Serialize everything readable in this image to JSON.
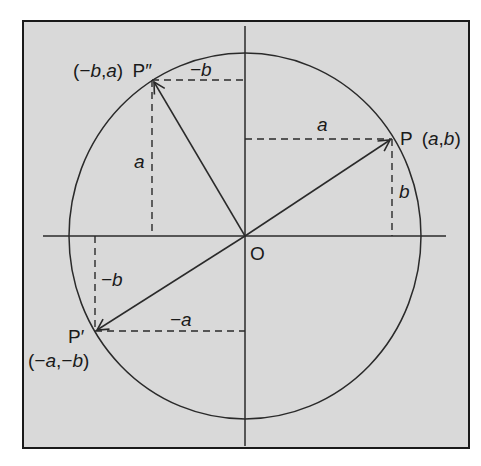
{
  "figure": {
    "background": "#d9d9d9",
    "frame_color": "#1a1a1a",
    "line_color": "#2a2a2a",
    "origin_label": "O",
    "points": {
      "P": {
        "name": "P",
        "coords": "(a,b)",
        "coords_parts": [
          "(",
          "a",
          ",",
          "b",
          ")"
        ]
      },
      "P_prime": {
        "name": "P′",
        "coords": "(−a,−b)",
        "coords_parts": [
          "(",
          "−a",
          ",",
          "−b",
          ")"
        ]
      },
      "P_double_prime": {
        "name": "P″",
        "coords": "(−b,a)",
        "coords_parts": [
          "(",
          "−b",
          ",",
          "a",
          ")"
        ]
      }
    },
    "segment_labels": {
      "P_horizontal": "a",
      "P_vertical": "b",
      "P_prime_vertical": "−b",
      "P_prime_horizontal": "−a",
      "P_double_prime_horizontal": "−b",
      "P_double_prime_vertical": "a"
    }
  }
}
